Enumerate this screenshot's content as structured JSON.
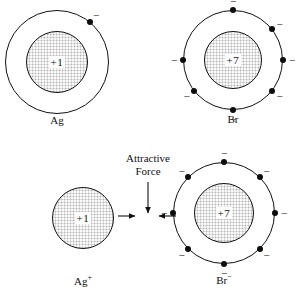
{
  "figure": {
    "caption": "",
    "background_color": "#ffffff",
    "nucleus_color": "#dcdcdc",
    "stroke_color": "#111111",
    "electron_color": "#0d0d0d"
  },
  "annotations": {
    "attractive_force": {
      "line1": "Attractive",
      "line2": "Force"
    },
    "electron_sign": "−"
  },
  "atoms": [
    {
      "id": "ag-atom",
      "label": "Ag",
      "charge": "+1",
      "cx": 57,
      "cy": 62,
      "nucleus_r": 31,
      "shell_r": 52,
      "label_x": 57,
      "label_y": 114,
      "electrons": [
        {
          "angle": -50,
          "sign_angle": -50
        }
      ]
    },
    {
      "id": "br-atom",
      "label": "Br",
      "charge": "+7",
      "cx": 233,
      "cy": 60,
      "nucleus_r": 29,
      "shell_r": 50,
      "label_x": 233,
      "label_y": 113,
      "electrons": [
        {
          "angle": -90,
          "sign_angle": -90
        },
        {
          "angle": -38,
          "sign_angle": -38
        },
        {
          "angle": 0,
          "sign_angle": 0
        },
        {
          "angle": 38,
          "sign_angle": 38
        },
        {
          "angle": 90,
          "sign_angle": 90
        },
        {
          "angle": 142,
          "sign_angle": 142
        },
        {
          "angle": 180,
          "sign_angle": 180
        }
      ]
    },
    {
      "id": "ag-ion",
      "label": "Ag",
      "label_sup": "+",
      "charge": "+1",
      "cx": 83,
      "cy": 218,
      "nucleus_r": 31,
      "shell_r": 0,
      "label_x": 83,
      "label_y": 273,
      "electrons": []
    },
    {
      "id": "br-ion",
      "label": "Br",
      "label_sup": "−",
      "charge": "+7",
      "cx": 224,
      "cy": 213,
      "nucleus_r": 30,
      "shell_r": 51,
      "label_x": 224,
      "label_y": 272,
      "electrons": [
        {
          "angle": -90,
          "sign_angle": -90
        },
        {
          "angle": -45,
          "sign_angle": -45
        },
        {
          "angle": 0,
          "sign_angle": 0
        },
        {
          "angle": 45,
          "sign_angle": 45
        },
        {
          "angle": 90,
          "sign_angle": 90
        },
        {
          "angle": 135,
          "sign_angle": 135
        },
        {
          "angle": 180,
          "sign_angle": 180
        },
        {
          "angle": 225,
          "sign_angle": 225
        }
      ]
    }
  ],
  "force_arrows": {
    "vertical": {
      "x": 148,
      "y1": 182,
      "y2": 213
    },
    "left": {
      "x1": 118,
      "x2": 135,
      "y": 216
    },
    "right": {
      "x1": 176,
      "x2": 159,
      "y": 216
    },
    "label_x": 148,
    "label_y": 152
  }
}
